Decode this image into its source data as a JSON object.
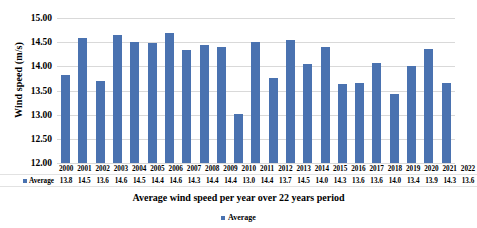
{
  "chart_data": {
    "type": "bar",
    "title": "",
    "xlabel": "Average wind speed per year over 22 years period",
    "ylabel": "Wind speed (m/s)",
    "ylim": [
      12.0,
      15.0
    ],
    "ytick_step": 0.5,
    "ytick_labels": [
      "15.00",
      "14.50",
      "14.00",
      "13.50",
      "13.00",
      "12.50",
      "12.00"
    ],
    "grid": true,
    "legend_position": "bottom",
    "series_name": "Average",
    "bar_color": "#4a72b0",
    "grid_color": "#d9d9d9",
    "categories": [
      "2000",
      "2001",
      "2002",
      "2003",
      "2004",
      "2005",
      "2006",
      "2007",
      "2008",
      "2009",
      "2010",
      "2011",
      "2012",
      "2013",
      "2014",
      "2015",
      "2016",
      "2017",
      "2018",
      "2019",
      "2020",
      "2021",
      "2022"
    ],
    "values": [
      13.83,
      14.59,
      13.7,
      14.65,
      14.51,
      14.49,
      14.69,
      14.33,
      14.45,
      14.41,
      13.02,
      14.5,
      13.76,
      14.54,
      14.04,
      14.4,
      13.63,
      13.66,
      14.06,
      13.42,
      14.01,
      14.36,
      13.66
    ],
    "table_values": [
      "13.8",
      "14.5",
      "13.6",
      "14.6",
      "14.5",
      "14.4",
      "14.6",
      "14.3",
      "14.4",
      "14.4",
      "13.0",
      "14.4",
      "13.7",
      "14.5",
      "14.0",
      "14.3",
      "13.6",
      "13.6",
      "14.0",
      "13.4",
      "13.9",
      "14.3",
      "13.6"
    ]
  },
  "legend": {
    "label": "Average"
  },
  "data_table": {
    "row_label": "Average"
  }
}
